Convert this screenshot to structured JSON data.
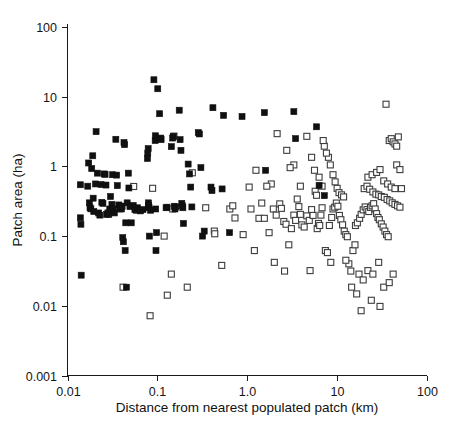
{
  "chart_data": {
    "type": "scatter",
    "title": "",
    "xlabel": "Distance from nearest populated patch (km)",
    "ylabel": "Patch area (ha)",
    "xscale": "log",
    "yscale": "log",
    "xlim": [
      0.01,
      100
    ],
    "ylim": [
      0.001,
      100
    ],
    "grid": false,
    "legend": "none",
    "xticks": [
      "0.01",
      "0.1",
      "1.0",
      "10",
      "100"
    ],
    "xtick_values": [
      0.01,
      0.1,
      1.0,
      10,
      100
    ],
    "yticks": [
      "100",
      "10",
      "1",
      "0.1",
      "0.01",
      "0.001"
    ],
    "ytick_values": [
      100,
      10,
      1,
      0.1,
      0.01,
      0.001
    ],
    "marker_size_px": 6,
    "series": [
      {
        "name": "occupied-patch",
        "marker": "filled-square",
        "color": "#101010",
        "points": [
          [
            0.0139,
            0.545
          ],
          [
            0.0139,
            0.183
          ],
          [
            0.0141,
            0.148
          ],
          [
            0.0142,
            0.0275
          ],
          [
            0.0168,
            0.52
          ],
          [
            0.0172,
            1.12
          ],
          [
            0.0175,
            0.3
          ],
          [
            0.0178,
            0.255
          ],
          [
            0.0182,
            0.246
          ],
          [
            0.0186,
            0.93
          ],
          [
            0.0191,
            1.42
          ],
          [
            0.0193,
            0.35
          ],
          [
            0.0196,
            0.225
          ],
          [
            0.0205,
            0.56
          ],
          [
            0.0208,
            3.15
          ],
          [
            0.0215,
            0.8
          ],
          [
            0.0222,
            0.215
          ],
          [
            0.0229,
            0.2
          ],
          [
            0.0236,
            0.55
          ],
          [
            0.0241,
            0.305
          ],
          [
            0.0248,
            0.295
          ],
          [
            0.0255,
            0.78
          ],
          [
            0.0262,
            0.77
          ],
          [
            0.0268,
            0.54
          ],
          [
            0.0272,
            0.205
          ],
          [
            0.0281,
            0.215
          ],
          [
            0.0288,
            0.205
          ],
          [
            0.0295,
            0.245
          ],
          [
            0.0301,
            0.37
          ],
          [
            0.0312,
            0.285
          ],
          [
            0.0318,
            0.76
          ],
          [
            0.0322,
            0.245
          ],
          [
            0.0332,
            0.215
          ],
          [
            0.0345,
            2.45
          ],
          [
            0.0352,
            0.75
          ],
          [
            0.0358,
            0.53
          ],
          [
            0.0372,
            0.28
          ],
          [
            0.0381,
            0.245
          ],
          [
            0.0392,
            0.27
          ],
          [
            0.0398,
            0.245
          ],
          [
            0.0405,
            0.265
          ],
          [
            0.0412,
            0.095
          ],
          [
            0.0418,
            0.083
          ],
          [
            0.0425,
            2.2
          ],
          [
            0.0432,
            2.05
          ],
          [
            0.0438,
            0.062
          ],
          [
            0.0445,
            0.155
          ],
          [
            0.0452,
            0.0185
          ],
          [
            0.0461,
            0.3
          ],
          [
            0.0475,
            0.8
          ],
          [
            0.0482,
            0.49
          ],
          [
            0.0495,
            0.265
          ],
          [
            0.0512,
            0.155
          ],
          [
            0.0538,
            0.275
          ],
          [
            0.0562,
            0.24
          ],
          [
            0.0585,
            0.235
          ],
          [
            0.0602,
            0.255
          ],
          [
            0.0648,
            0.23
          ],
          [
            0.0692,
            0.24
          ],
          [
            0.0775,
            1.3
          ],
          [
            0.0782,
            1.55
          ],
          [
            0.079,
            1.8
          ],
          [
            0.0795,
            0.3
          ],
          [
            0.08,
            0.275
          ],
          [
            0.0805,
            0.255
          ],
          [
            0.0815,
            0.1
          ],
          [
            0.0842,
            0.235
          ],
          [
            0.0915,
            17.5
          ],
          [
            0.0945,
            2.35
          ],
          [
            0.0952,
            2.75
          ],
          [
            0.0958,
            0.245
          ],
          [
            0.0965,
            0.062
          ],
          [
            0.0978,
            0.112
          ],
          [
            0.101,
            13.0
          ],
          [
            0.106,
            5.7
          ],
          [
            0.109,
            2.55
          ],
          [
            0.11,
            2.42
          ],
          [
            0.125,
            0.255
          ],
          [
            0.128,
            0.26
          ],
          [
            0.143,
            1.92
          ],
          [
            0.148,
            2.55
          ],
          [
            0.151,
            2.7
          ],
          [
            0.154,
            0.268
          ],
          [
            0.157,
            0.245
          ],
          [
            0.16,
            0.262
          ],
          [
            0.175,
            6.4
          ],
          [
            0.179,
            2.42
          ],
          [
            0.183,
            1.7
          ],
          [
            0.187,
            0.295
          ],
          [
            0.19,
            0.272
          ],
          [
            0.192,
            0.255
          ],
          [
            0.195,
            0.152
          ],
          [
            0.22,
            1.08
          ],
          [
            0.228,
            0.78
          ],
          [
            0.235,
            0.505
          ],
          [
            0.242,
            0.262
          ],
          [
            0.285,
            3.05
          ],
          [
            0.293,
            2.92
          ],
          [
            0.305,
            0.96
          ],
          [
            0.318,
            0.1
          ],
          [
            0.332,
            0.118
          ],
          [
            0.395,
            0.505
          ],
          [
            0.405,
            0.45
          ],
          [
            0.415,
            6.95
          ],
          [
            0.525,
            0.475
          ],
          [
            0.545,
            5.4
          ],
          [
            0.635,
            0.112
          ],
          [
            0.875,
            5.2
          ],
          [
            1.55,
            5.9
          ],
          [
            1.6,
            0.88
          ],
          [
            3.3,
            6.1
          ],
          [
            3.45,
            2.5
          ],
          [
            5.9,
            3.7
          ],
          [
            6.3,
            0.535
          ],
          [
            7.2,
            0.38
          ]
        ]
      },
      {
        "name": "unoccupied-patch",
        "marker": "open-square",
        "color": "#3c3c3c",
        "points": [
          [
            0.0415,
            0.0185
          ],
          [
            0.0545,
            0.515
          ],
          [
            0.08,
            0.262
          ],
          [
            0.083,
            0.0072
          ],
          [
            0.0885,
            0.485
          ],
          [
            0.119,
            0.1
          ],
          [
            0.129,
            0.0142
          ],
          [
            0.143,
            0.0285
          ],
          [
            0.148,
            0.245
          ],
          [
            0.153,
            2.72
          ],
          [
            0.215,
            0.0185
          ],
          [
            0.245,
            0.81
          ],
          [
            0.345,
            0.255
          ],
          [
            0.43,
            0.118
          ],
          [
            0.435,
            0.108
          ],
          [
            0.52,
            0.038
          ],
          [
            0.64,
            0.245
          ],
          [
            0.69,
            0.272
          ],
          [
            0.73,
            0.182
          ],
          [
            0.9,
            0.105
          ],
          [
            1.05,
            0.505
          ],
          [
            1.1,
            0.245
          ],
          [
            1.2,
            0.062
          ],
          [
            1.35,
            0.18
          ],
          [
            1.55,
            0.18
          ],
          [
            1.75,
            0.112
          ],
          [
            1.95,
            0.245
          ],
          [
            2.1,
            0.2
          ],
          [
            2.3,
            0.29
          ],
          [
            2.4,
            0.25
          ],
          [
            2.55,
            0.162
          ],
          [
            2.7,
            0.148
          ],
          [
            2.9,
            0.075
          ],
          [
            3.1,
            0.128
          ],
          [
            3.3,
            0.2
          ],
          [
            3.45,
            0.168
          ],
          [
            3.75,
            0.265
          ],
          [
            3.9,
            0.205
          ],
          [
            4.05,
            0.145
          ],
          [
            4.3,
            0.135
          ],
          [
            4.6,
            0.195
          ],
          [
            4.9,
            0.168
          ],
          [
            5.2,
            0.24
          ],
          [
            5.4,
            0.198
          ],
          [
            5.7,
            0.44
          ],
          [
            5.9,
            0.385
          ],
          [
            6.0,
            0.128
          ],
          [
            6.2,
            0.152
          ],
          [
            6.4,
            0.142
          ],
          [
            6.6,
            0.2
          ],
          [
            6.8,
            0.255
          ],
          [
            6.3,
            0.7
          ],
          [
            5.6,
            0.88
          ],
          [
            5.2,
            1.35
          ],
          [
            4.6,
            2.7
          ],
          [
            3.9,
            0.52
          ],
          [
            3.6,
            0.34
          ],
          [
            3.3,
            1.05
          ],
          [
            3.0,
            0.96
          ],
          [
            2.75,
            1.7
          ],
          [
            2.15,
            2.95
          ],
          [
            1.85,
            0.56
          ],
          [
            1.65,
            0.52
          ],
          [
            1.45,
            0.298
          ],
          [
            1.25,
            0.88
          ],
          [
            7.4,
            0.062
          ],
          [
            7.8,
            0.058
          ],
          [
            8.2,
            0.142
          ],
          [
            8.7,
            0.185
          ],
          [
            9.0,
            0.245
          ],
          [
            9.4,
            0.26
          ],
          [
            9.8,
            0.298
          ],
          [
            10.2,
            0.268
          ],
          [
            10.6,
            0.198
          ],
          [
            11.0,
            0.172
          ],
          [
            11.5,
            0.145
          ],
          [
            12.0,
            0.118
          ],
          [
            12.5,
            0.105
          ],
          [
            13.0,
            0.098
          ],
          [
            10.0,
            0.485
          ],
          [
            10.5,
            0.42
          ],
          [
            11.2,
            0.39
          ],
          [
            11.8,
            0.365
          ],
          [
            9.5,
            0.6
          ],
          [
            9.0,
            0.76
          ],
          [
            8.4,
            1.05
          ],
          [
            8.0,
            1.35
          ],
          [
            7.6,
            1.55
          ],
          [
            7.2,
            1.95
          ],
          [
            7.0,
            2.35
          ],
          [
            6.8,
            0.52
          ],
          [
            13.5,
            0.04
          ],
          [
            14.2,
            0.0315
          ],
          [
            15.0,
            0.062
          ],
          [
            15.8,
            0.075
          ],
          [
            16.5,
            0.0148
          ],
          [
            17.5,
            0.0285
          ],
          [
            18.5,
            0.0085
          ],
          [
            19.5,
            0.0235
          ],
          [
            16.0,
            0.142
          ],
          [
            16.8,
            0.155
          ],
          [
            17.8,
            0.18
          ],
          [
            18.5,
            0.205
          ],
          [
            19.5,
            0.238
          ],
          [
            20.5,
            0.262
          ],
          [
            21.5,
            0.24
          ],
          [
            22.5,
            0.225
          ],
          [
            23.5,
            0.258
          ],
          [
            24.5,
            0.272
          ],
          [
            25.5,
            0.292
          ],
          [
            26.5,
            0.245
          ],
          [
            27.5,
            0.21
          ],
          [
            28.5,
            0.185
          ],
          [
            29.5,
            0.172
          ],
          [
            31.0,
            0.15
          ],
          [
            32.5,
            0.135
          ],
          [
            34.0,
            0.118
          ],
          [
            35.5,
            0.105
          ],
          [
            37.0,
            0.098
          ],
          [
            20.0,
            0.48
          ],
          [
            21.5,
            0.52
          ],
          [
            23.0,
            0.47
          ],
          [
            25.0,
            0.43
          ],
          [
            27.0,
            0.4
          ],
          [
            29.0,
            0.39
          ],
          [
            31.0,
            0.37
          ],
          [
            33.5,
            0.36
          ],
          [
            36.0,
            0.335
          ],
          [
            38.5,
            0.32
          ],
          [
            41.0,
            0.3
          ],
          [
            44.0,
            0.285
          ],
          [
            47.0,
            0.272
          ],
          [
            50.0,
            0.26
          ],
          [
            22.0,
            0.7
          ],
          [
            24.5,
            0.76
          ],
          [
            27.5,
            0.82
          ],
          [
            30.0,
            0.9
          ],
          [
            33.0,
            0.62
          ],
          [
            36.5,
            0.56
          ],
          [
            40.0,
            0.505
          ],
          [
            44.0,
            0.48
          ],
          [
            38.0,
            2.35
          ],
          [
            40.0,
            2.5
          ],
          [
            42.0,
            2.25
          ],
          [
            44.0,
            2.1
          ],
          [
            46.0,
            1.95
          ],
          [
            48.0,
            2.65
          ],
          [
            35.0,
            7.8
          ],
          [
            46.0,
            1.05
          ],
          [
            50.0,
            0.9
          ],
          [
            52.0,
            0.48
          ],
          [
            22.0,
            0.032
          ],
          [
            25.0,
            0.0285
          ],
          [
            29.0,
            0.042
          ],
          [
            33.0,
            0.0185
          ],
          [
            38.0,
            0.0215
          ],
          [
            42.0,
            0.0285
          ],
          [
            30.0,
            0.0098
          ],
          [
            24.0,
            0.012
          ],
          [
            8.5,
            0.042
          ],
          [
            12.5,
            0.045
          ],
          [
            5.0,
            0.032
          ],
          [
            14.5,
            0.0185
          ],
          [
            2.0,
            0.042
          ],
          [
            2.6,
            0.0315
          ]
        ]
      }
    ]
  },
  "axes": {
    "x_title": "Distance from nearest populated patch (km)",
    "y_title": "Patch area (ha)"
  }
}
